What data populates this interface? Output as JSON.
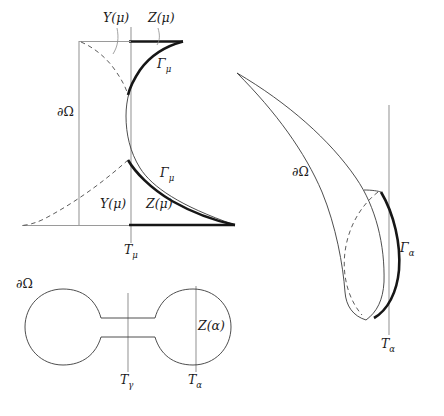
{
  "figure": {
    "background_color": "#ffffff",
    "colors": {
      "bold_curve": "#161616",
      "thin_curve": "#3a3a3a",
      "dashed_curve": "#4a4a4a",
      "axis_gray": "#9a9a9a",
      "text": "#1a1a1a"
    },
    "panels": [
      {
        "id": "top-left",
        "name": "S-curve panel with T-mu axis",
        "labels": [
          {
            "key": "y_mu_top",
            "text": "Y(μ)",
            "x": 103,
            "y": 22
          },
          {
            "key": "z_mu_top",
            "text": "Z(μ)",
            "x": 148,
            "y": 22
          },
          {
            "key": "gamma_upper",
            "base": "Γ",
            "sub": "μ",
            "x": 157,
            "y": 68
          },
          {
            "key": "omega_left",
            "text": "∂Ω",
            "x": 57,
            "y": 116
          },
          {
            "key": "gamma_lower",
            "base": "Γ",
            "sub": "μ",
            "x": 160,
            "y": 177
          },
          {
            "key": "y_mu_bot",
            "text": "Y(μ)",
            "x": 100,
            "y": 208
          },
          {
            "key": "z_mu_bot",
            "text": "Z(μ)",
            "x": 146,
            "y": 208
          },
          {
            "key": "t_mu",
            "base": "T",
            "sub": "μ",
            "x": 127,
            "y": 253
          }
        ]
      },
      {
        "id": "right",
        "name": "Crescent panel with T-alpha axis",
        "labels": [
          {
            "key": "omega_right",
            "text": "∂Ω",
            "x": 292,
            "y": 176
          },
          {
            "key": "gamma_alpha",
            "base": "Γ",
            "sub": "α",
            "x": 400,
            "y": 252
          },
          {
            "key": "t_alpha",
            "base": "T",
            "sub": "α",
            "x": 383,
            "y": 347
          }
        ]
      },
      {
        "id": "bottom-left",
        "name": "Dumbbell panel with T-gamma and T-alpha axes",
        "labels": [
          {
            "key": "omega_dumbbell",
            "text": "∂Ω",
            "x": 16,
            "y": 288
          },
          {
            "key": "z_alpha",
            "text": "Z(α)",
            "x": 198,
            "y": 330
          },
          {
            "key": "t_gamma",
            "base": "T",
            "sub": "γ",
            "x": 122,
            "y": 383
          },
          {
            "key": "t_alpha_2",
            "base": "T",
            "sub": "α",
            "x": 190,
            "y": 383
          }
        ]
      }
    ]
  }
}
